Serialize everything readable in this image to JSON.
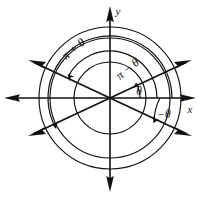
{
  "figure": {
    "colors": {
      "stroke": "#111111",
      "background": "#ffffff"
    },
    "geometry": {
      "center_x": 110,
      "center_y": 98,
      "circle_radii": [
        36,
        60,
        71
      ],
      "theta_degrees": 28,
      "x_axis_left": 4,
      "x_axis_right": 196,
      "y_axis_top": 6,
      "y_axis_bottom": 192
    },
    "axes": [
      {
        "name": "x-axis",
        "label": "x",
        "label_x": 190,
        "label_y": 112,
        "direction": "horizontal"
      },
      {
        "name": "y-axis",
        "label": "y",
        "label_x": 117,
        "label_y": 14,
        "direction": "vertical"
      }
    ],
    "rays": [
      {
        "name": "terminal-ray-theta",
        "angle_degrees": 28,
        "double_headed": true
      },
      {
        "name": "terminal-ray-pi-minus-theta",
        "angle_degrees": 152,
        "double_headed": true
      }
    ],
    "angle_labels": [
      {
        "name": "label-pi-plus-theta",
        "text": "π + θ",
        "x": 76,
        "y": 52,
        "rotation": -40,
        "size": "big"
      },
      {
        "name": "label-pi-minus-theta",
        "text": "π − θ",
        "x": 130,
        "y": 72,
        "rotation": -40,
        "size": "big"
      },
      {
        "name": "label-theta",
        "x": 139,
        "y": 95,
        "text": "θ",
        "rotation": 0,
        "size": "small"
      },
      {
        "name": "label-negative-theta",
        "x": 162,
        "y": 117,
        "text": "−θ",
        "rotation": 0,
        "size": "small"
      }
    ],
    "arcs": [
      {
        "name": "arc-theta",
        "radius": 30,
        "from_degrees": 0,
        "to_degrees": 28,
        "arrow_at": "end"
      },
      {
        "name": "arc-negative-theta",
        "radius": 50,
        "from_degrees": 0,
        "to_degrees": -28,
        "arrow_at": "end"
      },
      {
        "name": "arc-pi-minus-theta",
        "radius": 47,
        "from_degrees": 0,
        "to_degrees": 152,
        "arrow_at": "end"
      },
      {
        "name": "arc-pi-plus-theta",
        "radius": 62,
        "from_degrees": 0,
        "to_degrees": 208,
        "arrow_at": "end"
      }
    ]
  }
}
